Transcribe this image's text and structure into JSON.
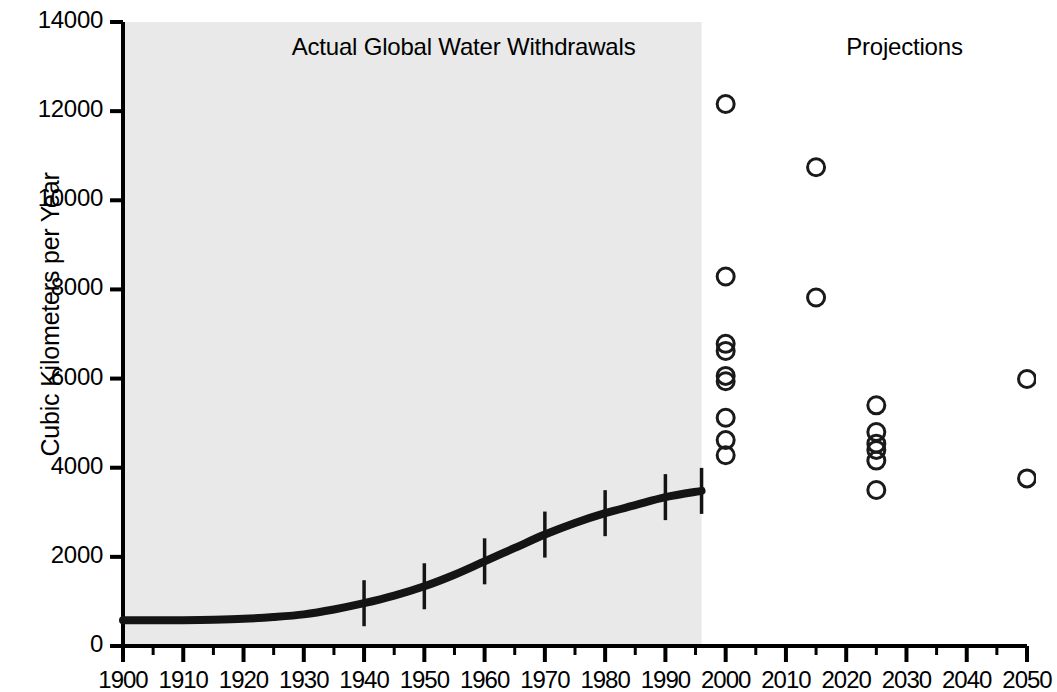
{
  "chart_data": {
    "type": "line",
    "title": "",
    "xlabel": "",
    "ylabel": "Cubic Kilometers per Year",
    "xlim": [
      1900,
      2050
    ],
    "ylim": [
      0,
      14000
    ],
    "grid": false,
    "legend_position": "none",
    "x_ticks": [
      1900,
      1910,
      1920,
      1930,
      1940,
      1950,
      1960,
      1970,
      1980,
      1990,
      2000,
      2010,
      2020,
      2030,
      2040,
      2050
    ],
    "x_tick_labels": [
      "1900",
      "1910",
      "1920",
      "1930",
      "1940",
      "1950",
      "1960",
      "1970",
      "1980",
      "1990",
      "2000",
      "2010",
      "2020",
      "2030",
      "2040",
      "2050"
    ],
    "x_minor_tick_interval": 5,
    "y_ticks": [
      0,
      2000,
      4000,
      6000,
      8000,
      10000,
      12000,
      14000
    ],
    "y_tick_labels": [
      "0",
      "2000",
      "4000",
      "6000",
      "8000",
      "10000",
      "12000",
      "14000"
    ],
    "annotations": [
      {
        "text": "Actual Global Water Withdrawals",
        "x": 1928,
        "y": 13400
      },
      {
        "text": "Projections",
        "x": 2020,
        "y": 13400
      }
    ],
    "shaded_region": {
      "x_start": 1900,
      "x_end": 1996,
      "color": "#e9e9e9"
    },
    "series": [
      {
        "name": "Actual Global Water Withdrawals",
        "type": "line",
        "color": "#141414",
        "x": [
          1900,
          1905,
          1910,
          1915,
          1920,
          1925,
          1930,
          1935,
          1940,
          1945,
          1950,
          1955,
          1960,
          1965,
          1970,
          1975,
          1980,
          1985,
          1990,
          1996
        ],
        "values": [
          580,
          578,
          580,
          590,
          610,
          650,
          710,
          820,
          960,
          1130,
          1340,
          1600,
          1900,
          2200,
          2500,
          2760,
          2980,
          3160,
          3340,
          3480
        ],
        "markers_x": [
          1940,
          1950,
          1960,
          1970,
          1980,
          1990,
          1996
        ],
        "markers_y": [
          960,
          1340,
          1900,
          2500,
          2980,
          3340,
          3480
        ]
      },
      {
        "name": "Projections",
        "type": "scatter",
        "marker": "open-circle",
        "color": "#1a1a1a",
        "points": [
          {
            "x": 2000,
            "y": 12160
          },
          {
            "x": 2000,
            "y": 8290
          },
          {
            "x": 2000,
            "y": 6780
          },
          {
            "x": 2000,
            "y": 6620
          },
          {
            "x": 2000,
            "y": 6060
          },
          {
            "x": 2000,
            "y": 5940
          },
          {
            "x": 2000,
            "y": 5120
          },
          {
            "x": 2000,
            "y": 4620
          },
          {
            "x": 2000,
            "y": 4280
          },
          {
            "x": 2015,
            "y": 10740
          },
          {
            "x": 2015,
            "y": 7820
          },
          {
            "x": 2025,
            "y": 5400
          },
          {
            "x": 2025,
            "y": 4800
          },
          {
            "x": 2025,
            "y": 4540
          },
          {
            "x": 2025,
            "y": 4400
          },
          {
            "x": 2025,
            "y": 4160
          },
          {
            "x": 2025,
            "y": 3500
          },
          {
            "x": 2050,
            "y": 5990
          },
          {
            "x": 2050,
            "y": 3760
          }
        ]
      }
    ]
  },
  "axis": {
    "y_label": "Cubic Kilometers per Year"
  },
  "labels": {
    "actual_region": "Actual Global Water Withdrawals",
    "projections_region": "Projections"
  }
}
